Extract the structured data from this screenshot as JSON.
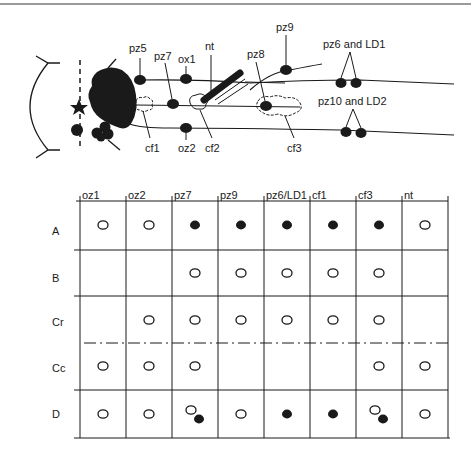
{
  "diagram": {
    "labels": {
      "pz5": "pz5",
      "pz7": "pz7",
      "ox1": "ox1",
      "nt": "nt",
      "pz8": "pz8",
      "pz9": "pz9",
      "pz6_ld1": "pz6 and LD1",
      "pz10_ld2": "pz10 and LD2",
      "cf1": "cf1",
      "oz2": "oz2",
      "cf2": "cf2",
      "cf3": "cf3"
    }
  },
  "table": {
    "columns": [
      "oz1",
      "oz2",
      "pz7",
      "pz9",
      "pz6/LD1",
      "cf1",
      "cf3",
      "nt"
    ],
    "rows": [
      {
        "label": "A",
        "cells": [
          "open",
          "open",
          "filled",
          "filled",
          "filled",
          "filled",
          "filled",
          "open"
        ]
      },
      {
        "label": "B",
        "cells": [
          "",
          "",
          "open",
          "open",
          "open",
          "open",
          "open",
          ""
        ]
      },
      {
        "label": "Cr",
        "cells": [
          "",
          "open",
          "open",
          "open",
          "open",
          "open",
          "open",
          ""
        ]
      },
      {
        "label": "Cc",
        "cells": [
          "open",
          "open",
          "open",
          "",
          "",
          "",
          "open",
          "open"
        ]
      },
      {
        "label": "D",
        "cells": [
          "open",
          "open",
          "both",
          "open",
          "filled",
          "filled",
          "both",
          "open"
        ]
      }
    ],
    "legend_note": "open = open circle, filled = filled circle, both = open and filled circle"
  },
  "colors": {
    "ink": "#1a1a1a",
    "background": "#ffffff"
  }
}
